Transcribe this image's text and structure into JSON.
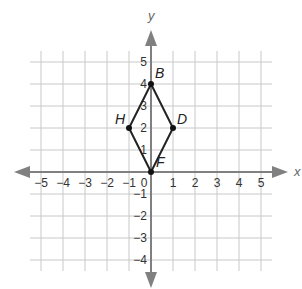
{
  "diagram": {
    "type": "coordinate-plane",
    "axes": {
      "x_label": "x",
      "y_label": "y",
      "x_range": [
        -5,
        5
      ],
      "y_range": [
        -4,
        5
      ],
      "x_ticks": [
        "−5",
        "−4",
        "−3",
        "−2",
        "−1",
        "0",
        "1",
        "2",
        "3",
        "4",
        "5"
      ],
      "y_ticks": [
        "5",
        "4",
        "3",
        "2",
        "1",
        "−1",
        "−2",
        "−3",
        "−4"
      ],
      "axis_color": "#808080"
    },
    "shape": {
      "name": "quadrilateral BDFH",
      "stroke_color": "#222222",
      "vertices": [
        {
          "label": "B",
          "x": 0,
          "y": 4
        },
        {
          "label": "D",
          "x": 1,
          "y": 2
        },
        {
          "label": "F",
          "x": 0,
          "y": 0
        },
        {
          "label": "H",
          "x": -1,
          "y": 2
        }
      ]
    }
  }
}
